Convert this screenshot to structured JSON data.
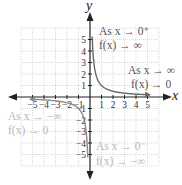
{
  "chart_data": {
    "type": "line",
    "title": "",
    "function": "f(x) = 1/x",
    "xlabel": "x",
    "ylabel": "y",
    "xlim": [
      -6,
      6
    ],
    "ylim": [
      -6,
      6
    ],
    "grid": true,
    "x_ticks": [
      -5,
      -4,
      -3,
      -2,
      -1,
      1,
      2,
      3,
      4,
      5
    ],
    "y_ticks": [
      5,
      4,
      3,
      2,
      1,
      -1,
      -2,
      -3,
      -4,
      -5
    ],
    "series": [
      {
        "name": "right branch",
        "x": [
          0.2,
          0.25,
          0.33,
          0.5,
          1,
          2,
          3,
          4,
          5
        ],
        "y": [
          5,
          4,
          3,
          2,
          1,
          0.5,
          0.33,
          0.25,
          0.2
        ]
      },
      {
        "name": "left branch",
        "x": [
          -5,
          -4,
          -3,
          -2,
          -1,
          -0.5,
          -0.33,
          -0.25,
          -0.2
        ],
        "y": [
          -0.2,
          -0.25,
          -0.33,
          -0.5,
          -1,
          -2,
          -3,
          -4,
          -5
        ]
      }
    ],
    "annotations": [
      {
        "line1": "As x → 0⁺",
        "line2": "f(x) → ∞",
        "quadrant": "I-top"
      },
      {
        "line1": "As x → ∞",
        "line2": "f(x) → 0",
        "quadrant": "I-right"
      },
      {
        "line1": "As x → −∞",
        "line2": "f(x) → 0",
        "quadrant": "III-left"
      },
      {
        "line1": "As x → 0⁻",
        "line2": "f(x) → −∞",
        "quadrant": "III-bottom"
      }
    ],
    "colors": {
      "axis": "#222222",
      "grid": "#c8c8c8",
      "curve_right": "#666666",
      "curve_left": "#8a8a8a",
      "text_dark": "#555555",
      "text_light": "#b8b8b8"
    }
  },
  "labels": {
    "x_axis": "x",
    "y_axis": "y",
    "note1_line1": "As x → 0⁺",
    "note1_line2": "f(x) → ∞",
    "note2_line1": "As x → ∞",
    "note2_line2": "f(x) → 0",
    "note3_line1": "As x → −∞",
    "note3_line2": "f(x) → 0",
    "note4_line1": "As x → 0⁻",
    "note4_line2": "f(x) → −∞"
  }
}
